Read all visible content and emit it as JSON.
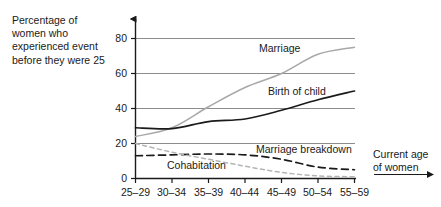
{
  "chart_data": {
    "type": "line",
    "title": "",
    "ylabel": "Percentage of women who experienced event before they were 25",
    "xlabel": "Current age of women",
    "categories": [
      "25–29",
      "30–34",
      "35–39",
      "40–44",
      "45–49",
      "50–54",
      "55–59"
    ],
    "ylim": [
      0,
      80
    ],
    "yticks": [
      "0",
      "20",
      "40",
      "60",
      "80"
    ],
    "ytick_values": [
      0,
      20,
      40,
      60,
      80
    ],
    "grid": "horizontal",
    "legend": "inline-labels",
    "series": [
      {
        "name": "Marriage",
        "style": "solid",
        "color": "#a8a8a8",
        "values": [
          24,
          29,
          41,
          52,
          60,
          71,
          75
        ]
      },
      {
        "name": "Birth of child",
        "style": "solid",
        "color": "#1a1a1a",
        "values": [
          29,
          28.5,
          32.5,
          34,
          39,
          45,
          50
        ]
      },
      {
        "name": "Marriage breakdown",
        "style": "dashed",
        "color": "#1a1a1a",
        "values": [
          13,
          13.5,
          14,
          13.5,
          11,
          6.5,
          5
        ]
      },
      {
        "name": "Cohabitation",
        "style": "dashed",
        "color": "#b4b4b4",
        "values": [
          20,
          15,
          11,
          7,
          3.5,
          1.5,
          1
        ]
      }
    ]
  },
  "axes": {
    "y_caption": "Percentage of\nwomen who\nexperienced event\nbefore they were 25",
    "x_caption": "Current age\nof women"
  },
  "series_labels": {
    "marriage": "Marriage",
    "birth_of_child": "Birth of child",
    "marriage_breakdown": "Marriage breakdown",
    "cohabitation": "Cohabitation"
  },
  "colors": {
    "axis": "#1a1a1a",
    "grid": "#8c8c8c",
    "light_series": "#a8a8a8",
    "dark_series": "#1a1a1a",
    "background": "#ffffff"
  }
}
